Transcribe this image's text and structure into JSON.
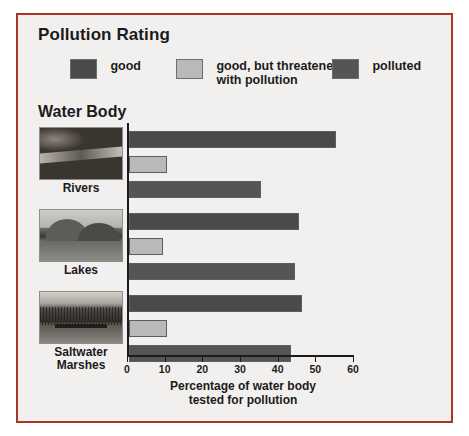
{
  "legend": {
    "title": "Pollution Rating",
    "items": [
      {
        "label": "good",
        "color": "#4a4a4a"
      },
      {
        "label": "good, but threatened\nwith pollution",
        "label_line1": "good, but threatened",
        "label_line2": "with pollution",
        "color": "#b9b9b9"
      },
      {
        "label": "polluted",
        "color": "#555555"
      }
    ]
  },
  "category_header": "Water Body",
  "axis": {
    "ticks": [
      "0",
      "10",
      "20",
      "30",
      "40",
      "50",
      "60"
    ],
    "xlabel_line1": "Percentage of water body",
    "xlabel_line2": "tested for pollution"
  },
  "thumbnails": [
    {
      "caption": "Rivers",
      "art": "river-photo"
    },
    {
      "caption": "Lakes",
      "art": "lake-photo"
    },
    {
      "caption": "Saltwater\nMarshes",
      "caption_line1": "Saltwater",
      "caption_line2": "Marshes",
      "art": "marsh-photo"
    }
  ],
  "chart_data": {
    "type": "bar",
    "orientation": "horizontal",
    "title": "Pollution Rating",
    "categories": [
      "Rivers",
      "Lakes",
      "Saltwater Marshes"
    ],
    "series": [
      {
        "name": "good",
        "color": "#4a4a4a",
        "values": [
          55,
          45,
          46
        ]
      },
      {
        "name": "good, but threatened with pollution",
        "color": "#b9b9b9",
        "values": [
          10,
          9,
          10
        ]
      },
      {
        "name": "polluted",
        "color": "#555555",
        "values": [
          35,
          44,
          43
        ]
      }
    ],
    "xlabel": "Percentage of water body tested for pollution",
    "ylabel": "Water Body",
    "xlim": [
      0,
      60
    ],
    "xticks": [
      0,
      10,
      20,
      30,
      40,
      50,
      60
    ],
    "grid": false,
    "legend_position": "top"
  }
}
